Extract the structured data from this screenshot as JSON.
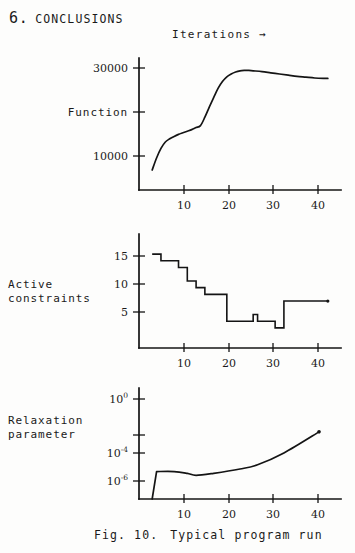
{
  "section": {
    "number": "6.",
    "title": "CONCLUSIONS"
  },
  "xaxis_caption": "Iterations →",
  "figure": {
    "number": "Fig. 10.",
    "caption": "Typical program run"
  },
  "chart_data": [
    {
      "type": "line",
      "title": "",
      "series_label": "Function",
      "xlabel": "Iterations",
      "ylabel": "Function",
      "xlim": [
        0,
        46
      ],
      "ylim": [
        0,
        33000
      ],
      "xticks": [
        10,
        20,
        30,
        40
      ],
      "xtick_labels": [
        "10",
        "20",
        "30",
        "40"
      ],
      "yticks": [
        30000,
        20000,
        10000
      ],
      "ytick_labels": [
        "30000",
        "",
        "10000"
      ],
      "grid": false,
      "legend": "none",
      "x": [
        3,
        4,
        5,
        6,
        7,
        8,
        9,
        10,
        11,
        12,
        13,
        14,
        15,
        16,
        17,
        18,
        19,
        20,
        21,
        22,
        23,
        24,
        25,
        26,
        28,
        30,
        32,
        34,
        36,
        38,
        40,
        42,
        43
      ],
      "values": [
        28000,
        25000,
        22600,
        21000,
        20200,
        19600,
        19100,
        18700,
        18300,
        17900,
        17400,
        16900,
        14800,
        12300,
        9900,
        7600,
        5900,
        4700,
        4000,
        3500,
        3200,
        3100,
        3100,
        3200,
        3400,
        3700,
        4000,
        4300,
        4600,
        4800,
        5000,
        5100,
        5100
      ]
    },
    {
      "type": "line",
      "title": "",
      "series_label": "Active constraints",
      "xlabel": "Iterations",
      "ylabel": "Active constraints",
      "xlim": [
        0,
        46
      ],
      "ylim": [
        0,
        17
      ],
      "xticks": [
        10,
        20,
        30,
        40
      ],
      "xtick_labels": [
        "10",
        "20",
        "30",
        "40"
      ],
      "yticks": [
        5,
        10,
        15
      ],
      "ytick_labels": [
        "5",
        "10",
        "15"
      ],
      "grid": false,
      "legend": "none",
      "step": true,
      "x": [
        3,
        5,
        9,
        11,
        13,
        15,
        20,
        25,
        26,
        27,
        29,
        31,
        33,
        43
      ],
      "values": [
        3,
        4,
        5,
        7,
        8,
        9,
        13,
        13,
        12,
        13,
        13,
        14,
        10,
        10
      ]
    },
    {
      "type": "line",
      "title": "",
      "series_label": "Relaxation parameter",
      "xlabel": "Iterations",
      "ylabel": "Relaxation parameter",
      "xlim": [
        0,
        46
      ],
      "ylim": [
        1e-07,
        1
      ],
      "log_y": true,
      "xticks": [
        10,
        20,
        30,
        40
      ],
      "xtick_labels": [
        "10",
        "20",
        "30",
        "40"
      ],
      "yticks": [
        1,
        0.0001,
        1e-06
      ],
      "ytick_labels": [
        "10⁰",
        "10⁻⁴",
        "10⁻⁶"
      ],
      "ytick_mantissa": [
        "10",
        "10",
        "10"
      ],
      "ytick_exponent": [
        "0",
        "-4",
        "-6"
      ],
      "grid": false,
      "legend": "none",
      "x": [
        3,
        4,
        8,
        11,
        13,
        17,
        23,
        27,
        33,
        41
      ],
      "values": [
        1.0,
        0.012,
        0.012,
        0.016,
        0.022,
        0.016,
        0.008,
        0.004,
        0.0006,
        2e-05
      ]
    }
  ]
}
